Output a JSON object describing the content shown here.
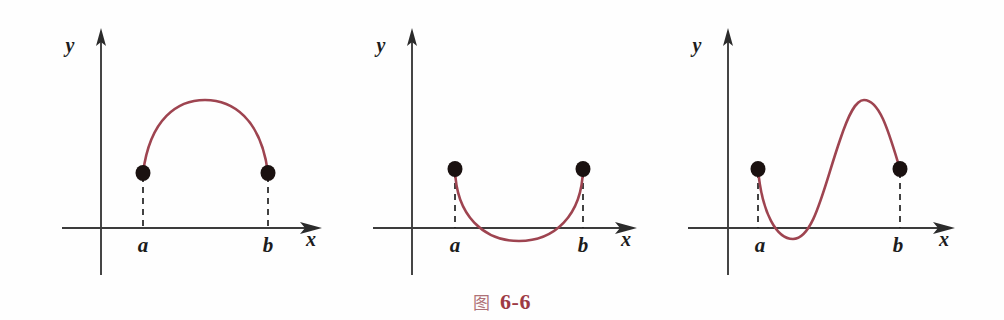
{
  "figure": {
    "caption_mark": "图",
    "caption_number": "6-6",
    "caption_color": "#9d3a44",
    "background_color": "#fefefe",
    "curve_color": "#9e4450",
    "axis_color": "#3c3c3c",
    "dot_color": "#1a1110"
  },
  "chart_data": {
    "type": "line",
    "title": "图 6-6",
    "subtitle": "Three curves on [a, b] with equal endpoint values f(a) = f(b)",
    "panels": [
      {
        "id": "panel-1",
        "shape": "single-arch-above-axis",
        "xlabel": "x",
        "ylabel": "y",
        "tick_labels": [
          "a",
          "b"
        ],
        "endpoints": [
          {
            "label": "a",
            "x": 143,
            "y": 173,
            "marker": "filled-dot"
          },
          {
            "label": "b",
            "x": 268,
            "y": 173,
            "marker": "filled-dot"
          }
        ],
        "extrema": [
          {
            "kind": "maximum",
            "x": 205,
            "y": 100
          }
        ],
        "axis_y": 228,
        "axis_x": 101,
        "curve_path": "M143,173 C150,118 178,100 205,100 C232,100 261,118 268,173",
        "grid": false,
        "legend": false
      },
      {
        "id": "panel-2",
        "shape": "single-valley-crossing-axis",
        "xlabel": "x",
        "ylabel": "y",
        "tick_labels": [
          "a",
          "b"
        ],
        "endpoints": [
          {
            "label": "a",
            "x": 455,
            "y": 169,
            "marker": "filled-dot"
          },
          {
            "label": "b",
            "x": 583,
            "y": 169,
            "marker": "filled-dot"
          }
        ],
        "extrema": [
          {
            "kind": "minimum",
            "x": 519,
            "y": 241
          }
        ],
        "axis_y": 228,
        "axis_x": 412,
        "curve_path": "M455,169 C456,216 484,241 519,241 C554,241 582,216 583,169",
        "grid": false,
        "legend": false
      },
      {
        "id": "panel-3",
        "shape": "wave-min-then-max",
        "xlabel": "x",
        "ylabel": "y",
        "tick_labels": [
          "a",
          "b"
        ],
        "endpoints": [
          {
            "label": "a",
            "x": 758,
            "y": 169,
            "marker": "filled-dot"
          },
          {
            "label": "b",
            "x": 900,
            "y": 169,
            "marker": "filled-dot"
          }
        ],
        "extrema": [
          {
            "kind": "minimum",
            "x": 793,
            "y": 239
          },
          {
            "kind": "maximum",
            "x": 864,
            "y": 100
          }
        ],
        "axis_y": 228,
        "axis_x": 728,
        "curve_path": "M758,169 C762,214 777,239 793,239 C814,239 824,186 840,140 C849,113 856,100 864,100 C880,100 889,133 900,169",
        "grid": false,
        "legend": false
      }
    ],
    "axis_labels": {
      "x": "x",
      "y": "y"
    }
  }
}
